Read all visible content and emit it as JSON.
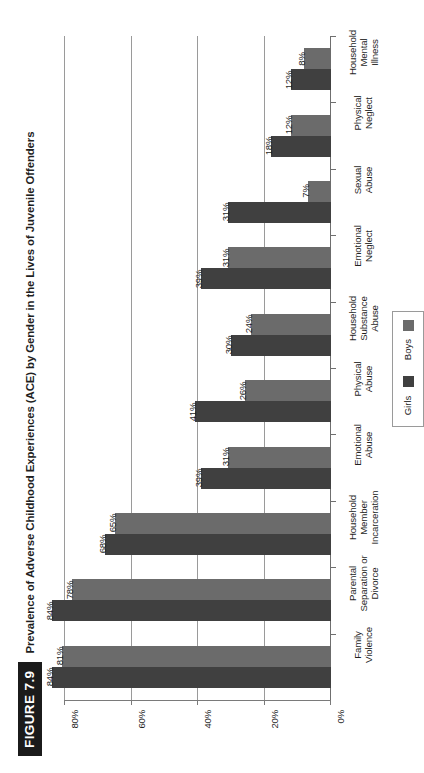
{
  "figure": {
    "badge": "FIGURE 7.9",
    "title": "Prevalence of Adverse Childhood Experiences (ACE) by Gender in the Lives of Juvenile Offenders"
  },
  "legend": {
    "items": [
      {
        "label": "Girls",
        "color": "#404040"
      },
      {
        "label": "Boys",
        "color": "#6b6b6b"
      }
    ]
  },
  "axis": {
    "ticks": [
      "80%",
      "60%",
      "40%",
      "20%",
      "0%"
    ],
    "values": [
      80,
      60,
      40,
      20,
      0
    ]
  },
  "chart_data": {
    "type": "bar",
    "title": "Prevalence of Adverse Childhood Experiences (ACE) by Gender in the Lives of Juvenile Offenders",
    "orientation": "horizontal",
    "xlabel": "",
    "ylabel": "",
    "xlim": [
      0,
      80
    ],
    "axis_reversed": true,
    "grid": true,
    "legend_position": "right",
    "categories": [
      "Family Violence",
      "Parental Separation or Divorce",
      "Household Member Incarceration",
      "Emotional Abuse",
      "Physical Abuse",
      "Household Substance Abuse",
      "Emotional Neglect",
      "Sexual Abuse",
      "Physical Neglect",
      "Household Mental Illness"
    ],
    "category_lines": [
      [
        "Family",
        "Violence"
      ],
      [
        "Parental",
        "Separation or",
        "Divorce"
      ],
      [
        "Household",
        "Member",
        "Incarceration"
      ],
      [
        "Emotional",
        "Abuse"
      ],
      [
        "Physical",
        "Abuse"
      ],
      [
        "Household",
        "Substance",
        "Abuse"
      ],
      [
        "Emotional",
        "Neglect"
      ],
      [
        "Sexual",
        "Abuse"
      ],
      [
        "Physical",
        "Neglect"
      ],
      [
        "Household",
        "Mental",
        "Illness"
      ]
    ],
    "series": [
      {
        "name": "Girls",
        "color": "#404040",
        "values": [
          84,
          84,
          68,
          39,
          41,
          30,
          39,
          31,
          18,
          12
        ],
        "labels": [
          "84%",
          "84%",
          "68%",
          "39%",
          "41%",
          "30%",
          "39%",
          "31%",
          "18%",
          "12%"
        ]
      },
      {
        "name": "Boys",
        "color": "#6b6b6b",
        "values": [
          81,
          78,
          65,
          31,
          26,
          24,
          31,
          7,
          12,
          8
        ],
        "labels": [
          "81%",
          "78%",
          "65%",
          "31%",
          "26%",
          "24%",
          "31%",
          "7%",
          "12%",
          "8%"
        ]
      }
    ]
  }
}
